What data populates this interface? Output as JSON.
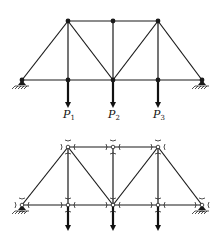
{
  "figure": {
    "top": {
      "title": "Loaded truss",
      "nodes": {
        "A": [
          22,
          80
        ],
        "B": [
          68,
          80
        ],
        "C": [
          113,
          80
        ],
        "D": [
          158,
          80
        ],
        "E": [
          202,
          80
        ],
        "F": [
          68,
          21
        ],
        "G": [
          113,
          21
        ],
        "H": [
          158,
          21
        ]
      },
      "members": [
        [
          "A",
          "E"
        ],
        [
          "F",
          "H"
        ],
        [
          "A",
          "F"
        ],
        [
          "F",
          "B"
        ],
        [
          "F",
          "C"
        ],
        [
          "G",
          "C"
        ],
        [
          "H",
          "C"
        ],
        [
          "H",
          "D"
        ],
        [
          "H",
          "E"
        ]
      ],
      "supports": [
        "A",
        "E"
      ],
      "loads": [
        {
          "node": "B",
          "label": "P",
          "sub": "1"
        },
        {
          "node": "C",
          "label": "P",
          "sub": "2"
        },
        {
          "node": "D",
          "label": "P",
          "sub": "3"
        }
      ],
      "load_length": 27
    },
    "bottom": {
      "title": "Free-body joint forces",
      "nodes": {
        "A": [
          22,
          205
        ],
        "B": [
          68,
          205
        ],
        "C": [
          113,
          205
        ],
        "D": [
          158,
          205
        ],
        "E": [
          202,
          205
        ],
        "F": [
          68,
          147
        ],
        "G": [
          113,
          147
        ],
        "H": [
          158,
          147
        ]
      },
      "members": [
        [
          "A",
          "E"
        ],
        [
          "F",
          "H"
        ],
        [
          "A",
          "F"
        ],
        [
          "F",
          "B"
        ],
        [
          "F",
          "C"
        ],
        [
          "G",
          "C"
        ],
        [
          "H",
          "C"
        ],
        [
          "H",
          "D"
        ],
        [
          "H",
          "E"
        ]
      ],
      "supports": [
        "A",
        "E"
      ],
      "loads": [
        {
          "node": "B"
        },
        {
          "node": "C"
        },
        {
          "node": "D"
        }
      ],
      "load_length": 25
    },
    "colors": {
      "ink": "#1a1a1a",
      "background": "#ffffff"
    }
  }
}
